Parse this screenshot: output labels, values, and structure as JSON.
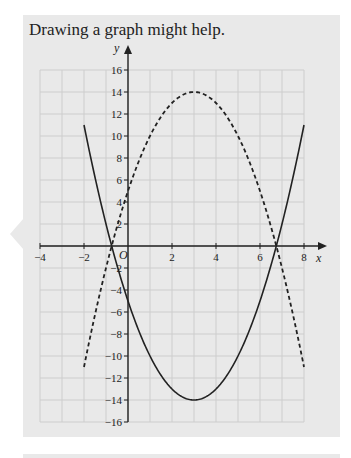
{
  "heading": "Drawing a graph might help.",
  "colors": {
    "panel": "#e9e9e9",
    "grid": "#cdcdcd",
    "axis": "#222222",
    "curve": "#222222"
  },
  "chart_data": {
    "type": "line",
    "title": "",
    "xlabel": "x",
    "ylabel": "y",
    "xlim": [
      -4,
      9
    ],
    "ylim": [
      -16,
      17
    ],
    "grid": true,
    "x_ticks": [
      -4,
      -2,
      0,
      2,
      4,
      6,
      8
    ],
    "x_tick_labels": [
      "−4",
      "−2",
      "0",
      "2",
      "4",
      "6",
      "8"
    ],
    "y_ticks": [
      -16,
      -14,
      -12,
      -10,
      -8,
      -6,
      -4,
      -2,
      2,
      4,
      6,
      8,
      10,
      12,
      14,
      16
    ],
    "y_tick_labels": [
      "−16",
      "−14",
      "−12",
      "−10",
      "−8",
      "−6",
      "−4",
      "−2",
      "2",
      "4",
      "6",
      "8",
      "10",
      "12",
      "14",
      "16"
    ],
    "origin_label": "O",
    "series": [
      {
        "name": "solid curve",
        "style": "solid",
        "equation": "y = x^2 - 6x - 5",
        "x": [
          -2,
          -1,
          0,
          1,
          2,
          3,
          4,
          5,
          6,
          7,
          8
        ],
        "y": [
          11,
          2,
          -5,
          -10,
          -13,
          -14,
          -13,
          -10,
          -5,
          2,
          11
        ]
      },
      {
        "name": "dashed curve",
        "style": "dashed",
        "equation": "y = -x^2 + 6x + 5",
        "x": [
          -2,
          -1,
          0,
          1,
          2,
          3,
          4,
          5,
          6,
          7,
          8
        ],
        "y": [
          -11,
          -2,
          5,
          10,
          13,
          14,
          13,
          10,
          5,
          -2,
          -11
        ]
      }
    ]
  }
}
